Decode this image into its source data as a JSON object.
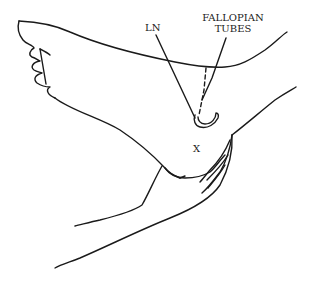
{
  "figure": {
    "type": "reflexology-line-illustration",
    "stroke_color": "#1a1a1a",
    "background_color": "#ffffff"
  },
  "labels": {
    "ln": "LN",
    "fallopian_line1": "FALLOPIAN",
    "fallopian_line2": "TUBES",
    "x_mark": "X"
  }
}
